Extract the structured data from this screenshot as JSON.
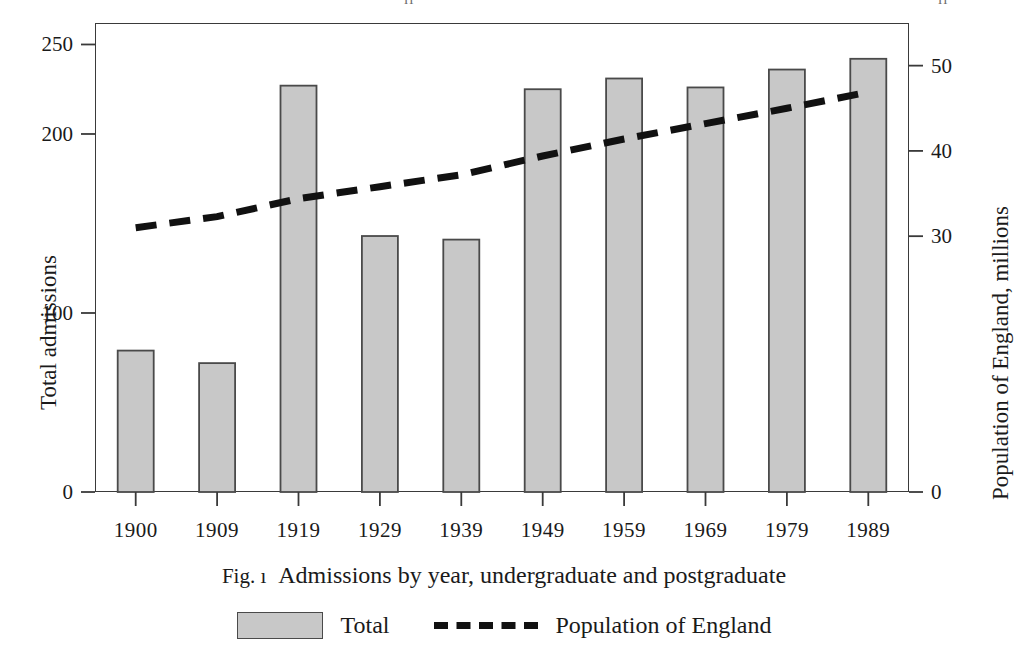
{
  "header_remnant": {
    "left_fragment": "ıı",
    "right_fragment": "ıı"
  },
  "figure": {
    "caption_number": "Fig. ı",
    "caption_text": "Admissions by year, undergraduate and postgraduate"
  },
  "axes": {
    "left_title": "Total admissions",
    "right_title": "Population of England, millions",
    "left_ticks": [
      "0",
      "100",
      "200",
      "250"
    ],
    "right_ticks": [
      "0",
      "30",
      "40",
      "50"
    ],
    "x_ticks": [
      "1900",
      "1909",
      "1919",
      "1929",
      "1939",
      "1949",
      "1959",
      "1969",
      "1979",
      "1989"
    ]
  },
  "legend": {
    "bar_label": "Total",
    "line_label": "Population of England"
  },
  "colors": {
    "bar_fill": "#c8c8c8",
    "bar_stroke": "#4a4a4a",
    "line_color": "#111111",
    "axis_color": "#3a3a3a",
    "text_color": "#1a1a1a"
  },
  "chart_data": {
    "type": "bar",
    "xlabel": "",
    "ylabel": "Total admissions",
    "y2label": "Population of England, millions",
    "categories": [
      "1900",
      "1909",
      "1919",
      "1929",
      "1939",
      "1949",
      "1959",
      "1969",
      "1979",
      "1989"
    ],
    "ylim": [
      0,
      262
    ],
    "y2lim": [
      0,
      55
    ],
    "yticks": [
      0,
      100,
      200,
      250
    ],
    "y2ticks": [
      0,
      30,
      40,
      50
    ],
    "grid": false,
    "legend_position": "below",
    "series": [
      {
        "name": "Total",
        "kind": "bar",
        "axis": "left",
        "values": [
          79,
          72,
          227,
          143,
          141,
          225,
          231,
          226,
          236,
          242
        ]
      },
      {
        "name": "Population of England",
        "kind": "line",
        "style": "dashed",
        "axis": "right",
        "values": [
          31.0,
          32.3,
          34.4,
          35.8,
          37.2,
          39.4,
          41.4,
          43.2,
          45.0,
          46.9
        ]
      }
    ]
  }
}
